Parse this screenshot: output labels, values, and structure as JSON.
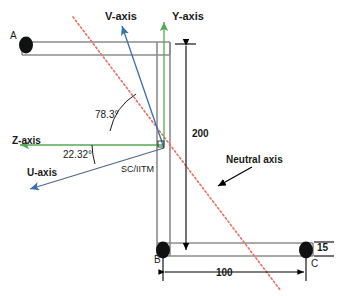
{
  "diagram": {
    "type": "engineering-cross-section",
    "colors": {
      "section_outline": "#8c8c8c",
      "principal_axis": "#3b6fa8",
      "centroidal_axis": "#4a9b4a",
      "neutral_axis": "#e8736a",
      "dimension": "#000000",
      "node": "#000000"
    },
    "axes": [
      {
        "id": "v-axis",
        "label": "V-axis",
        "color": "#3b6fa8",
        "kind": "principal"
      },
      {
        "id": "y-axis",
        "label": "Y-axis",
        "color": "#4a9b4a",
        "kind": "centroidal"
      },
      {
        "id": "z-axis",
        "label": "Z-axis",
        "color": "#4a9b4a",
        "kind": "centroidal"
      },
      {
        "id": "u-axis",
        "label": "U-axis",
        "color": "#3b6fa8",
        "kind": "principal"
      }
    ],
    "nodes": [
      {
        "id": "node-a",
        "label": "A"
      },
      {
        "id": "node-b",
        "label": "B"
      },
      {
        "id": "node-c",
        "label": "C"
      }
    ],
    "angles": [
      {
        "id": "angle-v-z",
        "label": "78.3°",
        "value": 78.3,
        "unit": "degree"
      },
      {
        "id": "angle-u-z",
        "label": "22.32°",
        "value": 22.32,
        "unit": "degree"
      }
    ],
    "dimensions": [
      {
        "id": "dim-height",
        "label": "200",
        "value": 200,
        "orientation": "vertical"
      },
      {
        "id": "dim-width",
        "label": "100",
        "value": 100,
        "orientation": "horizontal"
      },
      {
        "id": "dim-thickness",
        "label": "15",
        "value": 15,
        "orientation": "vertical"
      }
    ],
    "annotations": [
      {
        "id": "neutral-axis-label",
        "label": "Neutral axis"
      },
      {
        "id": "shear-centre-label",
        "label": "SC/IITM"
      }
    ]
  }
}
